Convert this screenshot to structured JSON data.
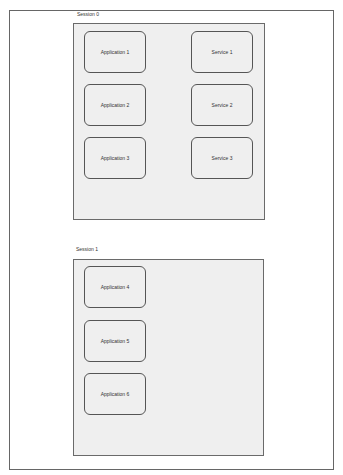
{
  "diagram": {
    "sessions": [
      {
        "label": "Session 0",
        "applications": [
          "Application 1",
          "Application 2",
          "Application 3"
        ],
        "services": [
          "Service 1",
          "Service 2",
          "Service 3"
        ]
      },
      {
        "label": "Session 1",
        "applications": [
          "Application 4",
          "Application 5",
          "Application 6"
        ],
        "services": []
      }
    ]
  },
  "colors": {
    "page_background": "#ffffff",
    "session_fill": "#efefef",
    "border": "#555555",
    "text": "#333333"
  }
}
